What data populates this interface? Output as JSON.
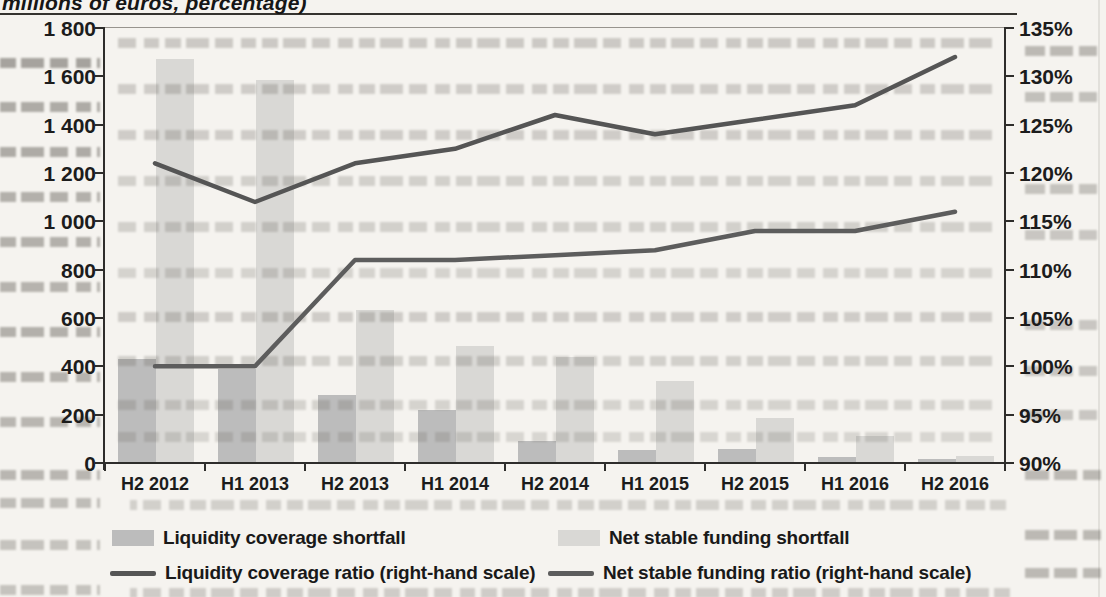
{
  "chart_data": {
    "type": "bar",
    "combo": "bar+line",
    "title": "millions of euros, percentage)",
    "categories": [
      "H2 2012",
      "H1 2013",
      "H2 2013",
      "H1 2014",
      "H2 2014",
      "H1 2015",
      "H2 2015",
      "H1 2016",
      "H2 2016"
    ],
    "series": [
      {
        "name": "Liquidity coverage shortfall",
        "kind": "bar",
        "axis": "left",
        "color": "#bcbcbc",
        "values": [
          430,
          390,
          280,
          220,
          90,
          55,
          60,
          25,
          15
        ]
      },
      {
        "name": "Net stable funding shortfall",
        "kind": "bar",
        "axis": "left",
        "color": "#d9d8d5",
        "values": [
          1670,
          1585,
          635,
          485,
          440,
          340,
          185,
          110,
          30
        ]
      },
      {
        "name": "Liquidity coverage ratio (right-hand scale)",
        "kind": "line",
        "axis": "right",
        "color": "#555555",
        "values": [
          121,
          117,
          121,
          122.5,
          126,
          124,
          125.5,
          127,
          132
        ]
      },
      {
        "name": "Net stable funding ratio (right-hand scale)",
        "kind": "line",
        "axis": "right",
        "color": "#5d5d5d",
        "values": [
          100,
          100,
          111,
          111,
          111.5,
          112,
          114,
          114,
          116
        ]
      }
    ],
    "left_axis": {
      "min": 0,
      "max": 1800,
      "step": 200,
      "tick_labels": [
        "1 800",
        "1 600",
        "1 400",
        "1 200",
        "1 000",
        "800",
        "600",
        "400",
        "200",
        "0"
      ]
    },
    "right_axis": {
      "min": 90,
      "max": 135,
      "step": 5,
      "unit": "%",
      "tick_labels": [
        "135%",
        "130%",
        "125%",
        "120%",
        "115%",
        "110%",
        "105%",
        "100%",
        "95%",
        "90%"
      ]
    },
    "legend_position": "bottom",
    "grid": "off"
  }
}
